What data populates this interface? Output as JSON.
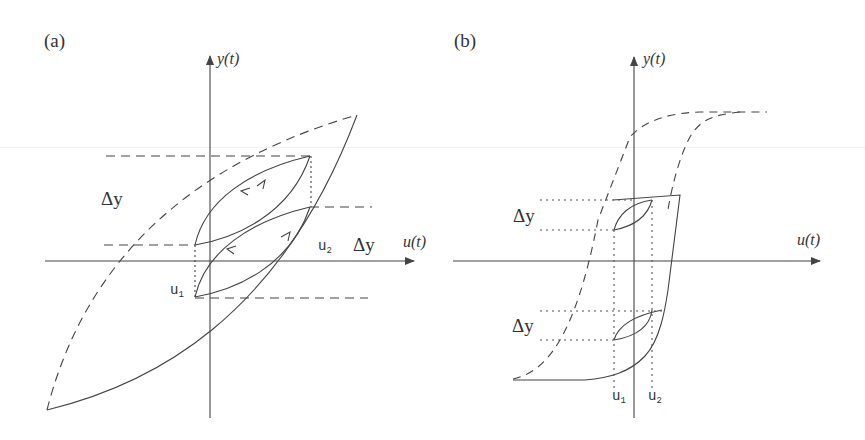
{
  "figure": {
    "panels": [
      {
        "id": "a",
        "label": "(a)",
        "y_axis_label": "y(t)",
        "x_axis_label": "u(t)",
        "delta_labels": [
          "Δy",
          "Δy"
        ],
        "u_labels": {
          "u1": "u",
          "u1_sub": "1",
          "u2": "u",
          "u2_sub": "2"
        },
        "description": "Lens-shaped major hysteresis loop with two congruent minor loops between u1 and u2, arrows showing traversal direction"
      },
      {
        "id": "b",
        "label": "(b)",
        "y_axis_label": "y(t)",
        "x_axis_label": "u(t)",
        "delta_labels": [
          "Δy",
          "Δy"
        ],
        "u_labels": {
          "u1": "u",
          "u1_sub": "1",
          "u2": "u",
          "u2_sub": "2"
        },
        "description": "Saturating (S-shaped) major hysteresis loop with two congruent minor loops between u1 and u2 at different output levels"
      }
    ],
    "colors": {
      "line": "#444444",
      "text": "#333333",
      "background": "#ffffff"
    }
  }
}
